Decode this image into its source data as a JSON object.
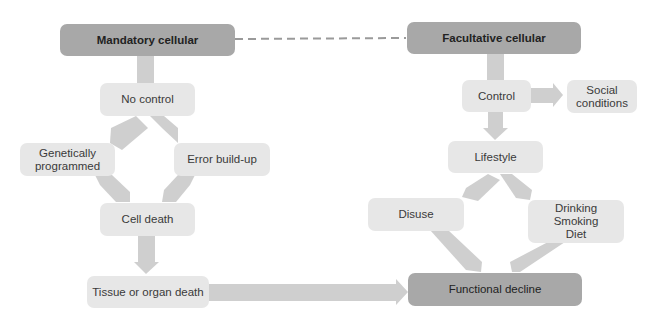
{
  "diagram": {
    "colors": {
      "primary_box": "#a8a8a8",
      "secondary_box": "#e7e7e7",
      "arrow": "#cfcfcf",
      "dashed_line": "#9a9a9a",
      "text": "#333333"
    },
    "nodes": {
      "mandatory": "Mandatory cellular",
      "facultative": "Facultative cellular",
      "no_control": "No control",
      "genetically": "Genetically\nprogrammed",
      "error": "Error build-up",
      "cell_death": "Cell death",
      "tissue": "Tissue or organ death",
      "control": "Control",
      "social": "Social\nconditions",
      "lifestyle": "Lifestyle",
      "disuse": "Disuse",
      "drinking": "Drinking\nSmoking\nDiet",
      "functional": "Functional decline"
    },
    "edges": [
      {
        "from": "mandatory",
        "to": "facultative",
        "style": "dashed"
      },
      {
        "from": "mandatory",
        "to": "no_control"
      },
      {
        "from": "no_control",
        "to": "genetically"
      },
      {
        "from": "no_control",
        "to": "error"
      },
      {
        "from": "genetically",
        "to": "cell_death"
      },
      {
        "from": "error",
        "to": "cell_death"
      },
      {
        "from": "cell_death",
        "to": "tissue"
      },
      {
        "from": "tissue",
        "to": "functional"
      },
      {
        "from": "facultative",
        "to": "control"
      },
      {
        "from": "control",
        "to": "social"
      },
      {
        "from": "control",
        "to": "lifestyle"
      },
      {
        "from": "lifestyle",
        "to": "disuse"
      },
      {
        "from": "lifestyle",
        "to": "drinking"
      },
      {
        "from": "disuse",
        "to": "functional"
      },
      {
        "from": "drinking",
        "to": "functional"
      }
    ]
  }
}
